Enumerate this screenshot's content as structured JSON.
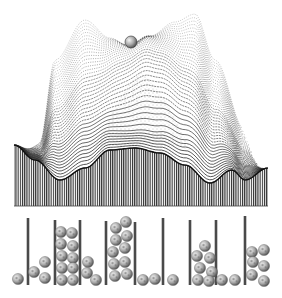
{
  "illustration": {
    "description": "Engraving-style energy landscape with a ball resting in a saddle, above a row of bins filled with balls",
    "colors": {
      "background": "#ffffff",
      "ink": "#1a1a1a",
      "post": "#4a4a4a",
      "ball_light": "#e8e8e8",
      "ball_dark": "#6a6a6a"
    },
    "landscape": {
      "top_ball": {
        "cx": 131,
        "cy": 42,
        "r": 6
      },
      "front_profile": [
        [
          14,
          145
        ],
        [
          35,
          160
        ],
        [
          60,
          180
        ],
        [
          85,
          168
        ],
        [
          110,
          150
        ],
        [
          135,
          148
        ],
        [
          160,
          153
        ],
        [
          185,
          165
        ],
        [
          210,
          183
        ],
        [
          232,
          170
        ],
        [
          245,
          180
        ],
        [
          268,
          168
        ]
      ],
      "base_y": 206
    },
    "bins": {
      "post_xs": [
        28,
        55,
        80,
        106,
        135,
        163,
        190,
        216,
        245
      ],
      "post_tops": [
        218,
        220,
        220,
        221,
        222,
        218,
        220,
        220,
        216
      ],
      "post_bottom": 285,
      "balls": [
        [
          18,
          279
        ],
        [
          34,
          272
        ],
        [
          45,
          262
        ],
        [
          45,
          278
        ],
        [
          61,
          232
        ],
        [
          72,
          233
        ],
        [
          61,
          244
        ],
        [
          73,
          246
        ],
        [
          62,
          256
        ],
        [
          73,
          258
        ],
        [
          62,
          268
        ],
        [
          73,
          268
        ],
        [
          62,
          280
        ],
        [
          73,
          280
        ],
        [
          88,
          262
        ],
        [
          87,
          273
        ],
        [
          96,
          280
        ],
        [
          116,
          228
        ],
        [
          126,
          222
        ],
        [
          116,
          240
        ],
        [
          127,
          236
        ],
        [
          113,
          252
        ],
        [
          125,
          248
        ],
        [
          114,
          264
        ],
        [
          125,
          262
        ],
        [
          115,
          276
        ],
        [
          127,
          274
        ],
        [
          143,
          280
        ],
        [
          155,
          279
        ],
        [
          173,
          280
        ],
        [
          205,
          246
        ],
        [
          197,
          256
        ],
        [
          210,
          258
        ],
        [
          200,
          268
        ],
        [
          212,
          272
        ],
        [
          198,
          280
        ],
        [
          209,
          281
        ],
        [
          222,
          280
        ],
        [
          235,
          280
        ],
        [
          252,
          252
        ],
        [
          264,
          250
        ],
        [
          253,
          262
        ],
        [
          264,
          266
        ],
        [
          252,
          275
        ],
        [
          264,
          281
        ]
      ]
    }
  }
}
